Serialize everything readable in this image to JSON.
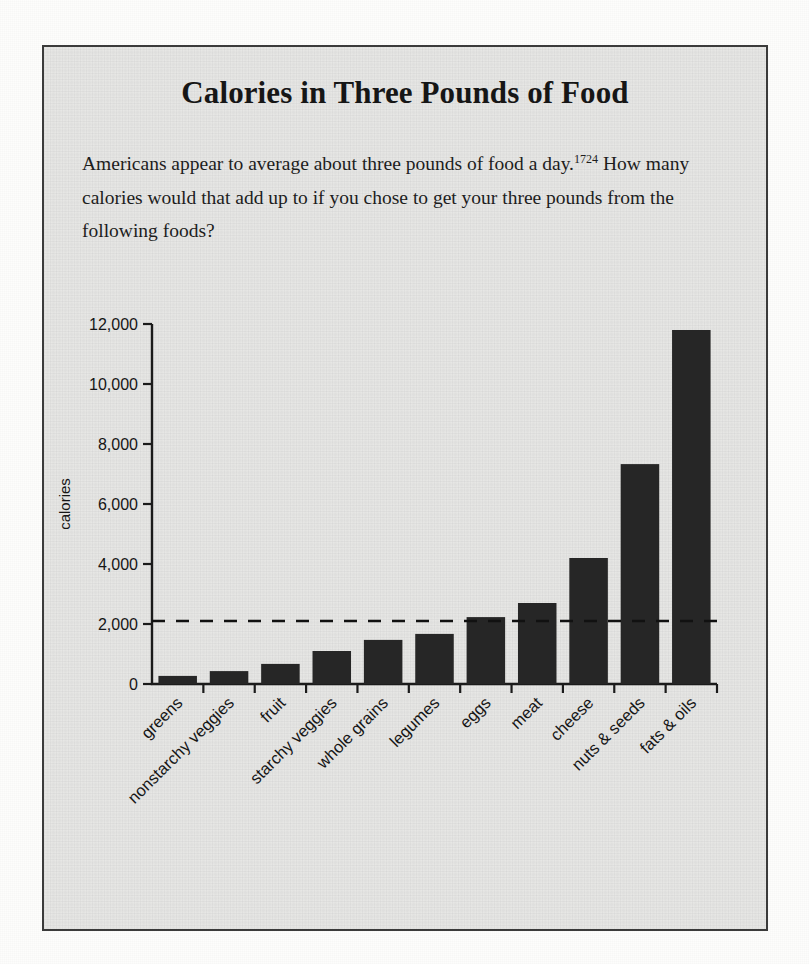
{
  "figure": {
    "title": "Calories in Three Pounds of Food",
    "body_part1": "Americans appear to average about three pounds of food a day.",
    "body_footnote": "1724",
    "body_part2": " How many calories would that add up to if you chose to get your three pounds from the following foods?"
  },
  "chart_data": {
    "type": "bar",
    "title": "Calories in Three Pounds of Food",
    "xlabel": "",
    "ylabel": "calories",
    "ylim": [
      0,
      12000
    ],
    "ytick_labels": [
      "0",
      "2,000",
      "4,000",
      "6,000",
      "8,000",
      "10,000",
      "12,000"
    ],
    "ytick_values": [
      0,
      2000,
      4000,
      6000,
      8000,
      10000,
      12000
    ],
    "grid": false,
    "legend": "none",
    "categories": [
      "greens",
      "nonstarchy veggies",
      "fruit",
      "starchy veggies",
      "whole grains",
      "legumes",
      "eggs",
      "meat",
      "cheese",
      "nuts & seeds",
      "fats & oils"
    ],
    "values": [
      270,
      430,
      670,
      1100,
      1470,
      1670,
      2230,
      2700,
      4200,
      7330,
      11800
    ],
    "annotations": [
      {
        "type": "reference-line",
        "orientation": "horizontal",
        "value": 2100,
        "style": "dashed",
        "label": ""
      }
    ],
    "colors": {
      "bar": "#262626",
      "axis": "#1b1b1b",
      "reference_line": "#111111",
      "panel_background": "#e7e7e5",
      "page_background": "#fdfdfc"
    }
  }
}
